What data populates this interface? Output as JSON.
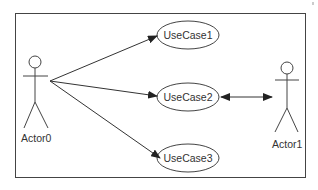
{
  "diagram": {
    "type": "uml-use-case",
    "actors": [
      {
        "id": "actor0",
        "label": "Actor0"
      },
      {
        "id": "actor1",
        "label": "Actor1"
      }
    ],
    "use_cases": [
      {
        "id": "uc1",
        "label": "UseCase1"
      },
      {
        "id": "uc2",
        "label": "UseCase2"
      },
      {
        "id": "uc3",
        "label": "UseCase3"
      }
    ],
    "associations": [
      {
        "from": "Actor0",
        "to": "UseCase1",
        "direction": "directed"
      },
      {
        "from": "Actor0",
        "to": "UseCase2",
        "direction": "directed"
      },
      {
        "from": "Actor0",
        "to": "UseCase3",
        "direction": "directed"
      },
      {
        "from": "UseCase2",
        "to": "Actor1",
        "direction": "bidirectional"
      }
    ],
    "colors": {
      "line": "#333333",
      "background": "#ffffff"
    }
  }
}
